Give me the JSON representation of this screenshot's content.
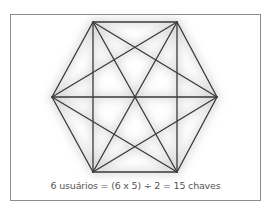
{
  "figure": {
    "caption": "6 usuários = (6 x 5) ÷ 2 = 15 chaves",
    "nodes": [
      {
        "id": "top-left",
        "x": 93,
        "y": 22
      },
      {
        "id": "top-right",
        "x": 177,
        "y": 22
      },
      {
        "id": "right",
        "x": 217,
        "y": 97
      },
      {
        "id": "bottom-right",
        "x": 177,
        "y": 172
      },
      {
        "id": "bottom-left",
        "x": 93,
        "y": 172
      },
      {
        "id": "left",
        "x": 52,
        "y": 97
      }
    ],
    "edge_count": 15,
    "line_color": "#3a3a3a",
    "glow_color": "#bdbdbd"
  }
}
